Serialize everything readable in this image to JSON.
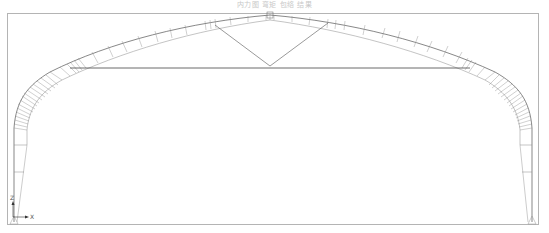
{
  "title": "内力图 弯矩 包络 结果",
  "diagram": {
    "type": "arch-truss-frame",
    "frame": {
      "x": 7,
      "y": 13,
      "width": 531,
      "height": 211,
      "color": "#b0b0b0"
    },
    "line_color": "#4a4a4a",
    "hatch_color": "#777777",
    "axis": {
      "x_label": "X",
      "z_label": "Z"
    },
    "members": [
      "left-column",
      "right-column",
      "arch-rafter",
      "tie-rod",
      "left-v-brace",
      "right-v-brace"
    ],
    "supports": [
      "left-pinned-support",
      "right-pinned-support"
    ]
  }
}
